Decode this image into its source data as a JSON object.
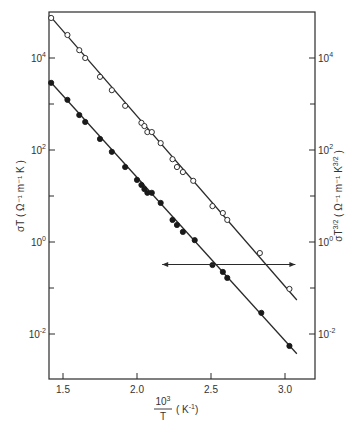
{
  "chart_data": {
    "type": "scatter",
    "title": "",
    "xlabel": "10^3 / T (K^-1)",
    "xlabel_parts": {
      "numerator": "10",
      "num_sup": "3",
      "denominator": "T",
      "unit": "( K",
      "unit_sup": "-1",
      "unit_end": ")"
    },
    "ylabel_left": "σT ( Ω⁻¹ m⁻¹ K )",
    "ylabel_right": "σT^3/2 ( Ω⁻¹ m⁻¹ K^3/2 )",
    "yscale": "log",
    "xlim": [
      1.41,
      3.2
    ],
    "ylim_log10": [
      -3.0,
      5.3
    ],
    "x_ticks": [
      {
        "value": 1.5,
        "label": "1.5"
      },
      {
        "value": 2.0,
        "label": "2.0"
      },
      {
        "value": 2.5,
        "label": "2.5"
      },
      {
        "value": 3.0,
        "label": "3.0"
      }
    ],
    "y_ticks": [
      {
        "exp": 4,
        "base": "10",
        "sup": "4"
      },
      {
        "exp": 2,
        "base": "10",
        "sup": "2"
      },
      {
        "exp": 0,
        "base": "10",
        "sup": "0"
      },
      {
        "exp": -2,
        "base": "10",
        "sup": "-2"
      }
    ],
    "y_minor_ticks_exp": [
      3,
      1,
      -1
    ],
    "grid": false,
    "annotation": {
      "type": "double-arrow",
      "y_log10": -0.5,
      "x_from": 2.17,
      "x_to": 3.07,
      "meaning": "open circles read on right axis, filled on left axis"
    },
    "series": [
      {
        "name": "σT^3/2 (right axis)",
        "marker": "open-circle",
        "axis": "right",
        "points": [
          [
            1.42,
            4.87
          ],
          [
            1.53,
            4.5
          ],
          [
            1.61,
            4.17
          ],
          [
            1.65,
            4.0
          ],
          [
            1.75,
            3.59
          ],
          [
            1.83,
            3.3
          ],
          [
            1.92,
            2.96
          ],
          [
            2.03,
            2.59
          ],
          [
            2.05,
            2.52
          ],
          [
            2.07,
            2.39
          ],
          [
            2.1,
            2.39
          ],
          [
            2.16,
            2.15
          ],
          [
            2.24,
            1.8
          ],
          [
            2.27,
            1.63
          ],
          [
            2.31,
            1.52
          ],
          [
            2.38,
            1.33
          ],
          [
            2.51,
            0.78
          ],
          [
            2.58,
            0.63
          ],
          [
            2.61,
            0.48
          ],
          [
            2.83,
            -0.24
          ],
          [
            3.03,
            -1.02
          ]
        ],
        "fit_line": [
          [
            1.41,
            4.92
          ],
          [
            3.08,
            -1.26
          ]
        ]
      },
      {
        "name": "σT (left axis)",
        "marker": "filled-circle",
        "axis": "left",
        "points": [
          [
            1.42,
            3.46
          ],
          [
            1.53,
            3.09
          ],
          [
            1.61,
            2.76
          ],
          [
            1.65,
            2.61
          ],
          [
            1.75,
            2.24
          ],
          [
            1.83,
            1.96
          ],
          [
            1.92,
            1.63
          ],
          [
            2.0,
            1.35
          ],
          [
            2.03,
            1.24
          ],
          [
            2.05,
            1.15
          ],
          [
            2.07,
            1.07
          ],
          [
            2.1,
            1.07
          ],
          [
            2.16,
            0.85
          ],
          [
            2.24,
            0.48
          ],
          [
            2.27,
            0.37
          ],
          [
            2.31,
            0.22
          ],
          [
            2.39,
            0.04
          ],
          [
            2.51,
            -0.5
          ],
          [
            2.58,
            -0.65
          ],
          [
            2.61,
            -0.78
          ],
          [
            2.84,
            -1.54
          ],
          [
            3.03,
            -2.26
          ]
        ],
        "fit_line": [
          [
            1.41,
            3.5
          ],
          [
            3.08,
            -2.43
          ]
        ]
      }
    ]
  },
  "labels": {
    "left_axis": "σT ( Ω⁻¹ m⁻¹ K )",
    "right_axis_main": "σT",
    "right_axis_sup": "3/2",
    "right_axis_rest": " ( Ω⁻¹ m⁻¹ K",
    "right_axis_sup2": "3/2",
    "right_axis_end": " )"
  }
}
